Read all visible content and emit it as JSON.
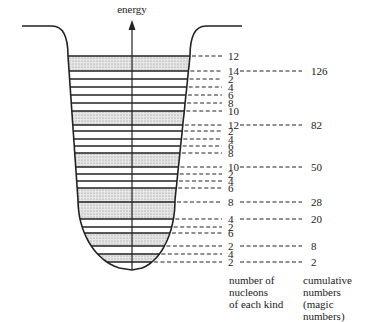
{
  "axis": {
    "label": "energy"
  },
  "captions": {
    "left": [
      "number of",
      "nucleons",
      "of each kind"
    ],
    "right": [
      "cumulative",
      "numbers",
      "(magic numbers)"
    ]
  },
  "colors": {
    "line": "#222222",
    "shade": "#cfcfcf",
    "background": "#ffffff"
  },
  "levels": [
    {
      "y": 56,
      "count": "12",
      "magic": "",
      "shaded_below": true
    },
    {
      "y": 71,
      "count": "14",
      "magic": "126",
      "shaded_below": false
    },
    {
      "y": 79,
      "count": "2",
      "magic": "",
      "shaded_below": false
    },
    {
      "y": 87,
      "count": "4",
      "magic": "",
      "shaded_below": false
    },
    {
      "y": 95,
      "count": "6",
      "magic": "",
      "shaded_below": false
    },
    {
      "y": 103,
      "count": "8",
      "magic": "",
      "shaded_below": false
    },
    {
      "y": 111,
      "count": "10",
      "magic": "",
      "shaded_below": true
    },
    {
      "y": 125,
      "count": "12",
      "magic": "82",
      "shaded_below": false
    },
    {
      "y": 131,
      "count": "2",
      "magic": "",
      "shaded_below": false
    },
    {
      "y": 139,
      "count": "4",
      "magic": "",
      "shaded_below": false
    },
    {
      "y": 146,
      "count": "6",
      "magic": "",
      "shaded_below": false
    },
    {
      "y": 153,
      "count": "8",
      "magic": "",
      "shaded_below": true
    },
    {
      "y": 167,
      "count": "10",
      "magic": "50",
      "shaded_below": false
    },
    {
      "y": 174,
      "count": "2",
      "magic": "",
      "shaded_below": false
    },
    {
      "y": 181,
      "count": "4",
      "magic": "",
      "shaded_below": false
    },
    {
      "y": 188,
      "count": "6",
      "magic": "",
      "shaded_below": true
    },
    {
      "y": 202,
      "count": "8",
      "magic": "28",
      "shaded_below": true
    },
    {
      "y": 219,
      "count": "4",
      "magic": "20",
      "shaded_below": false
    },
    {
      "y": 227,
      "count": "2",
      "magic": "",
      "shaded_below": false
    },
    {
      "y": 233,
      "count": "6",
      "magic": "",
      "shaded_below": true
    },
    {
      "y": 246,
      "count": "2",
      "magic": "8",
      "shaded_below": false
    },
    {
      "y": 254,
      "count": "4",
      "magic": "",
      "shaded_below": true
    },
    {
      "y": 262,
      "count": "2",
      "magic": "2",
      "shaded_below": false
    }
  ]
}
